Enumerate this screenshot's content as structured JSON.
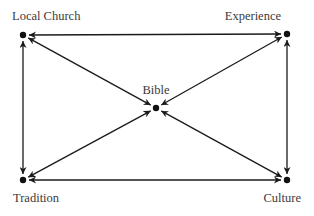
{
  "diagram": {
    "type": "network",
    "nodes": [
      {
        "id": "local_church",
        "label": "Local Church",
        "x": 23,
        "y": 35,
        "label_x": 12,
        "label_y": 20,
        "anchor": "start"
      },
      {
        "id": "experience",
        "label": "Experience",
        "x": 287,
        "y": 34,
        "label_x": 281,
        "label_y": 20,
        "anchor": "end"
      },
      {
        "id": "bible",
        "label": "Bible",
        "x": 156,
        "y": 108,
        "label_x": 156,
        "label_y": 94,
        "anchor": "middle"
      },
      {
        "id": "tradition",
        "label": "Tradition",
        "x": 23,
        "y": 180,
        "label_x": 13,
        "label_y": 202,
        "anchor": "start"
      },
      {
        "id": "culture",
        "label": "Culture",
        "x": 287,
        "y": 180,
        "label_x": 301,
        "label_y": 202,
        "anchor": "end"
      }
    ],
    "edges": [
      {
        "from": "local_church",
        "to": "experience",
        "direction": "both"
      },
      {
        "from": "tradition",
        "to": "culture",
        "direction": "both"
      },
      {
        "from": "local_church",
        "to": "tradition",
        "direction": "both"
      },
      {
        "from": "experience",
        "to": "culture",
        "direction": "both"
      },
      {
        "from": "local_church",
        "to": "bible",
        "direction": "both"
      },
      {
        "from": "experience",
        "to": "bible",
        "direction": "both"
      },
      {
        "from": "tradition",
        "to": "bible",
        "direction": "both"
      },
      {
        "from": "culture",
        "to": "bible",
        "direction": "both"
      }
    ],
    "colors": {
      "line": "#1a1a1a",
      "dot": "#111111",
      "text": "#3a3a3a"
    }
  }
}
